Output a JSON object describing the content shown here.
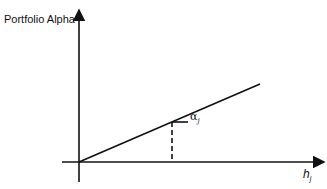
{
  "diagram": {
    "y_axis_label": "Portfolio Alpha",
    "x_axis_label": "h",
    "x_axis_subscript": "j",
    "point_label": "α",
    "point_subscript": "j",
    "colors": {
      "line": "#111111",
      "background": "#ffffff"
    }
  }
}
